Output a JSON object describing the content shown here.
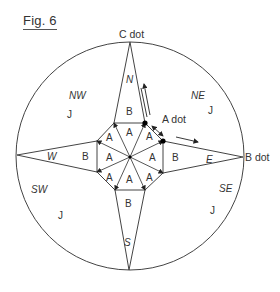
{
  "figure": {
    "title": "Fig. 6",
    "external_labels": {
      "top": "C dot",
      "right": "B dot",
      "inner": "A dot"
    },
    "direction_labels": {
      "north": "N",
      "south": "S",
      "east": "E",
      "west": "W",
      "northwest": "NW",
      "northeast": "NE",
      "southwest": "SW",
      "southeast": "SE"
    },
    "quadrant_region_label": "J",
    "kite_region_label": "B",
    "center_triangle_label": "A",
    "counts": {
      "center_triangles": 8,
      "kite_regions": 4,
      "quadrant_regions": 4
    },
    "colors": {
      "line": "#444444",
      "text": "#333333",
      "dot": "#000000"
    }
  }
}
